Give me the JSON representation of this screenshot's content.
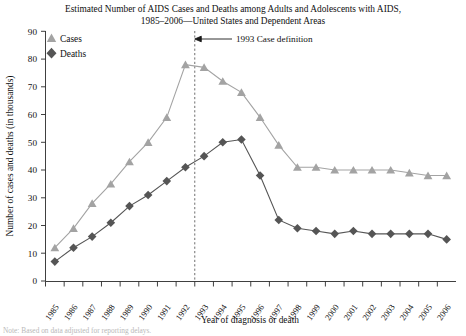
{
  "chart_data": {
    "type": "line",
    "title": "Estimated Number of AIDS Cases and Deaths among Adults and Adolescents with AIDS, 1985–2006—United States and Dependent Areas",
    "title_lines": [
      "Estimated Number of AIDS Cases and Deaths among Adults and Adolescents with AIDS,",
      "1985–2006—United States and Dependent Areas"
    ],
    "xlabel": "Year of diagnosis or death",
    "ylabel": "Number of cases and deaths (in thousands)",
    "categories": [
      "1985",
      "1986",
      "1987",
      "1988",
      "1989",
      "1990",
      "1991",
      "1992",
      "1993",
      "1994",
      "1995",
      "1996",
      "1997",
      "1998",
      "1999",
      "2000",
      "2001",
      "2002",
      "2003",
      "2004",
      "2005",
      "2006"
    ],
    "x": [
      1985,
      1986,
      1987,
      1988,
      1989,
      1990,
      1991,
      1992,
      1993,
      1994,
      1995,
      1996,
      1997,
      1998,
      1999,
      2000,
      2001,
      2002,
      2003,
      2004,
      2005,
      2006
    ],
    "series": [
      {
        "name": "Cases",
        "marker": "triangle",
        "color": "#a3a3a3",
        "values": [
          12,
          19,
          28,
          35,
          43,
          50,
          59,
          78,
          77,
          72,
          68,
          59,
          49,
          41,
          41,
          40,
          40,
          40,
          40,
          39,
          38,
          38
        ]
      },
      {
        "name": "Deaths",
        "marker": "diamond",
        "color": "#555555",
        "values": [
          7,
          12,
          16,
          21,
          27,
          31,
          36,
          41,
          45,
          50,
          51,
          38,
          22,
          19,
          18,
          17,
          18,
          17,
          17,
          17,
          17,
          15
        ]
      }
    ],
    "ylim": [
      0,
      90
    ],
    "yticks": [
      0,
      10,
      20,
      30,
      40,
      50,
      60,
      70,
      80,
      90
    ],
    "ytick_labels": [
      "0",
      "10",
      "20",
      "30",
      "40",
      "50",
      "60",
      "70",
      "80",
      "90"
    ],
    "grid": false,
    "legend_position": "upper-left-inside",
    "annotations": [
      {
        "name": "case-definition-marker",
        "text": "1993 Case definition",
        "at_x": 1992.5,
        "style": "vertical-dashed-line-with-left-arrow"
      }
    ],
    "note": "Note: Based on data adjusted for reporting delays."
  }
}
